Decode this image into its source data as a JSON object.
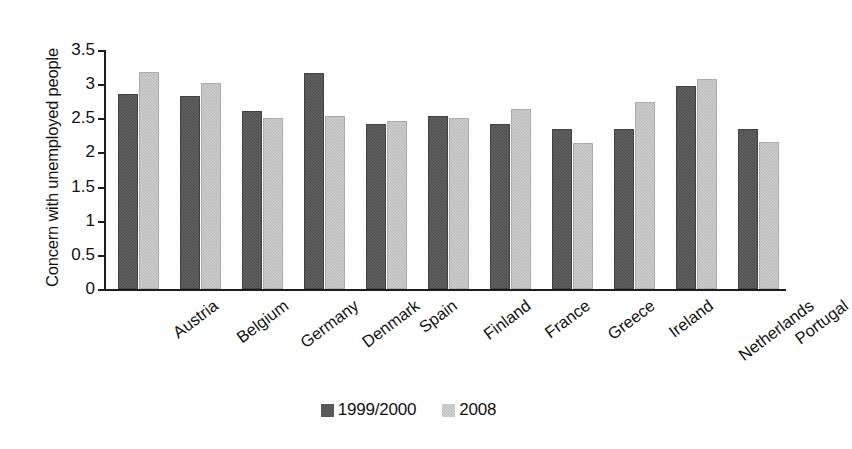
{
  "chart_data": {
    "type": "bar",
    "title": "",
    "xlabel": "",
    "ylabel": "Concern with unemployed people",
    "ylim": [
      0,
      3.5
    ],
    "yticks": [
      "0",
      "0.5",
      "1",
      "1.5",
      "2",
      "2.5",
      "3",
      "3.5"
    ],
    "ytick_values": [
      0,
      0.5,
      1,
      1.5,
      2,
      2.5,
      3,
      3.5
    ],
    "grid": false,
    "legend_position": "bottom-center",
    "categories": [
      "Austria",
      "Belgium",
      "Germany",
      "Denmark",
      "Spain",
      "Finland",
      "France",
      "Greece",
      "Ireland",
      "Netherlands",
      "Portugal"
    ],
    "series": [
      {
        "name": "1999/2000",
        "color": "#4d4d4d",
        "values": [
          2.85,
          2.83,
          2.61,
          3.16,
          2.42,
          2.53,
          2.42,
          2.34,
          2.35,
          2.97,
          2.34
        ]
      },
      {
        "name": "2008",
        "color": "#b9b9b9",
        "values": [
          3.18,
          3.02,
          2.51,
          2.53,
          2.46,
          2.5,
          2.63,
          2.14,
          2.74,
          3.08,
          2.16
        ]
      }
    ]
  },
  "legend": {
    "entries": [
      {
        "label": "1999/2000"
      },
      {
        "label": "2008"
      }
    ]
  }
}
